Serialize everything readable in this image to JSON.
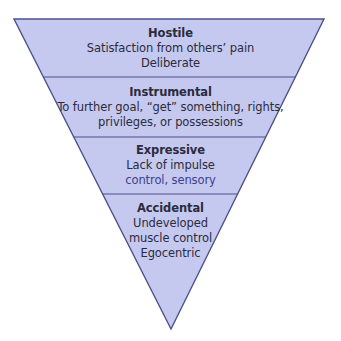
{
  "diagram": {
    "type": "inverted-pyramid",
    "colors": {
      "fill": "#c5c9ef",
      "stroke": "#4b508c",
      "text": "#2b2b3c"
    },
    "tiers": [
      {
        "title": "Hostile",
        "lines": [
          "Satisfaction from others’ pain",
          "Deliberate"
        ]
      },
      {
        "title": "Instrumental",
        "lines": [
          "To further goal, “get” something, rights,",
          "privileges, or possessions"
        ]
      },
      {
        "title": "Expressive",
        "lines": [
          "Lack of impulse",
          "control, sensory"
        ]
      },
      {
        "title": "Accidental",
        "lines": [
          "Undeveloped",
          "muscle control",
          "Egocentric"
        ]
      }
    ]
  }
}
